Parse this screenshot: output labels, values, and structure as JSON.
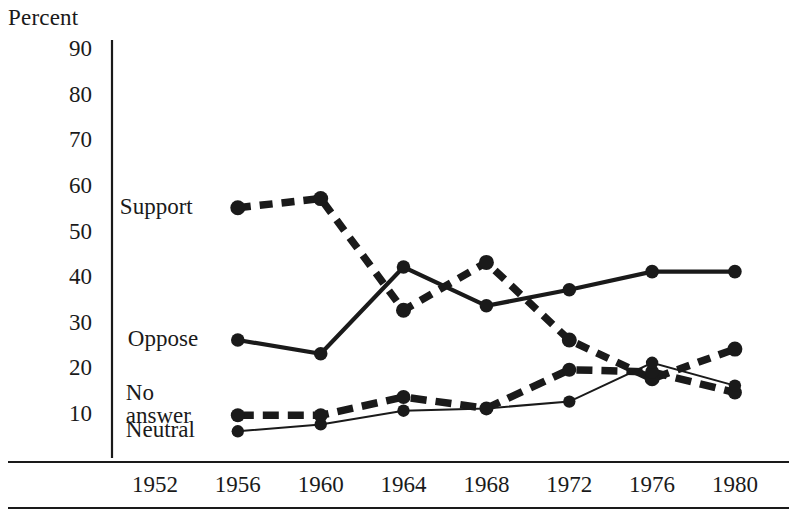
{
  "chart_data": {
    "type": "line",
    "title": "",
    "xlabel": "",
    "ylabel": "Percent",
    "categories": [
      "1952",
      "1956",
      "1960",
      "1964",
      "1968",
      "1972",
      "1976",
      "1980"
    ],
    "x": [
      1952,
      1956,
      1960,
      1964,
      1968,
      1972,
      1976,
      1980
    ],
    "ylim": [
      0,
      90
    ],
    "yticks": [
      90,
      80,
      70,
      60,
      50,
      40,
      30,
      20,
      10
    ],
    "grid": false,
    "legend_position": "inline-left",
    "series": [
      {
        "name": "Support",
        "style": "dashed",
        "marker": "circle",
        "x": [
          1956,
          1960,
          1964,
          1968,
          1972,
          1976,
          1980
        ],
        "values": [
          55,
          57,
          32.5,
          43,
          26,
          17.5,
          24
        ]
      },
      {
        "name": "Oppose",
        "style": "solid",
        "marker": "circle",
        "x": [
          1956,
          1960,
          1964,
          1968,
          1972,
          1976,
          1980
        ],
        "values": [
          26,
          23,
          42,
          33.5,
          37,
          41,
          41
        ]
      },
      {
        "name": "No answer",
        "style": "dashed-thick",
        "marker": "circle",
        "x": [
          1956,
          1960,
          1964,
          1968,
          1972,
          1976,
          1980
        ],
        "values": [
          9.5,
          9.5,
          13.5,
          11,
          19.5,
          19,
          14.5
        ]
      },
      {
        "name": "Neutral",
        "style": "thin",
        "marker": "circle",
        "x": [
          1956,
          1960,
          1964,
          1968,
          1972,
          1976,
          1980
        ],
        "values": [
          6,
          7.5,
          10.5,
          11,
          12.5,
          21,
          16
        ]
      }
    ],
    "annotations": [
      {
        "text": "Support",
        "series": "Support"
      },
      {
        "text": "Oppose",
        "series": "Oppose"
      },
      {
        "text": "No answer",
        "series": "No answer"
      },
      {
        "text": "Neutral",
        "series": "Neutral"
      }
    ],
    "colors": {
      "ink": "#1a1a1a",
      "background": "#ffffff"
    }
  },
  "axis": {
    "caption": "Percent",
    "yticks": [
      "90",
      "80",
      "70",
      "60",
      "50",
      "40",
      "30",
      "20",
      "10"
    ],
    "xticks": [
      "1952",
      "1956",
      "1960",
      "1964",
      "1968",
      "1972",
      "1976",
      "1980"
    ]
  },
  "labels": {
    "support": "Support",
    "oppose": "Oppose",
    "no_answer_line1": "No",
    "no_answer_line2": "answer",
    "neutral": "Neutral"
  }
}
